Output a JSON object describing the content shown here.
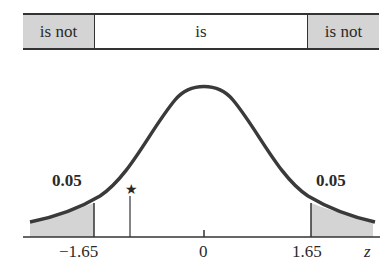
{
  "decision_bar": {
    "left_label": "is not",
    "center_label": "is",
    "right_label": "is not"
  },
  "distribution": {
    "left_tail_area": "0.05",
    "right_tail_area": "0.05",
    "marker_symbol": "★"
  },
  "axis": {
    "ticks": [
      "−1.65",
      "0",
      "1.65"
    ],
    "variable": "z"
  },
  "colors": {
    "shade": "#d4d4d4",
    "curve": "#3a3a3a"
  }
}
